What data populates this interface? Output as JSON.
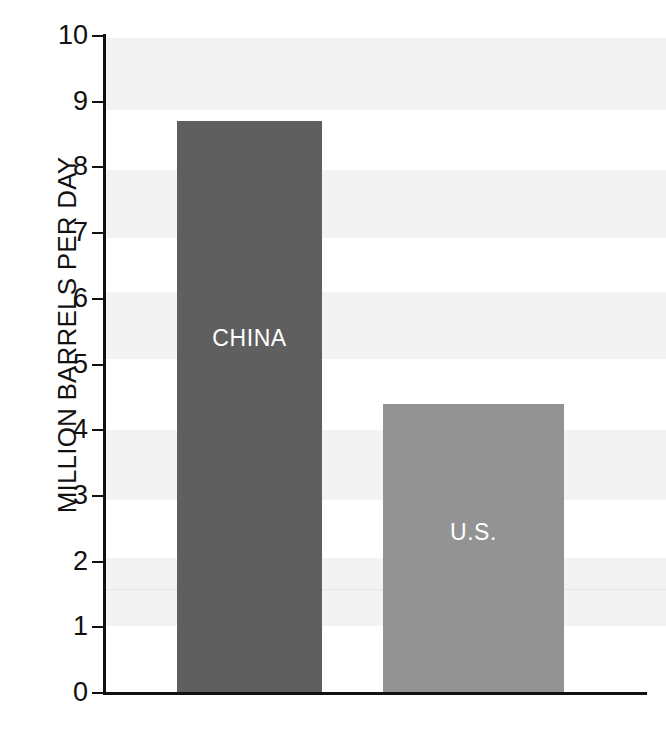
{
  "chart_data": {
    "type": "bar",
    "title": "",
    "subtitle": "",
    "xlabel": "",
    "ylabel": "MILLION BARRELS PER DAY",
    "categories": [
      "CHINA",
      "U.S."
    ],
    "values": [
      8.7,
      4.4
    ],
    "series": [
      {
        "name": "Crude oil imports",
        "values": [
          8.7,
          4.4
        ]
      }
    ],
    "ylim": [
      0,
      10
    ],
    "yticks": [
      0,
      1,
      2,
      3,
      4,
      5,
      6,
      7,
      8,
      9,
      10
    ],
    "ytick_labels": [
      "0",
      "1",
      "2",
      "3",
      "4",
      "5",
      "6",
      "7",
      "8",
      "9",
      "10"
    ],
    "grid": false,
    "legend": "none",
    "bar_labels_inside": true,
    "colors": {
      "china_bar": "#605F5F",
      "us_bar": "#939393",
      "axis": "#111111",
      "background": "#ffffff",
      "band": "#f3f3f3",
      "bar_label_text": "#ffffff"
    },
    "bars": [
      {
        "label": "CHINA",
        "value": 8.7,
        "color": "#605F5F",
        "left_px": 177,
        "width_px": 145,
        "label_center_y_px": 338
      },
      {
        "label": "U.S.",
        "value": 4.4,
        "color": "#939393",
        "left_px": 383,
        "width_px": 181,
        "label_center_y_px": 532
      }
    ]
  },
  "axis": {
    "y_title": "MILLION BARRELS PER DAY",
    "ticks": [
      {
        "label": "10",
        "value": 10
      },
      {
        "label": "9",
        "value": 9
      },
      {
        "label": "8",
        "value": 8
      },
      {
        "label": "7",
        "value": 7
      },
      {
        "label": "6",
        "value": 6
      },
      {
        "label": "5",
        "value": 5
      },
      {
        "label": "4",
        "value": 4
      },
      {
        "label": "3",
        "value": 3
      },
      {
        "label": "2",
        "value": 2
      },
      {
        "label": "1",
        "value": 1
      },
      {
        "label": "0",
        "value": 0
      }
    ]
  },
  "bars": {
    "china": {
      "label": "CHINA",
      "value": 8.7
    },
    "us": {
      "label": "U.S.",
      "value": 4.4
    }
  }
}
